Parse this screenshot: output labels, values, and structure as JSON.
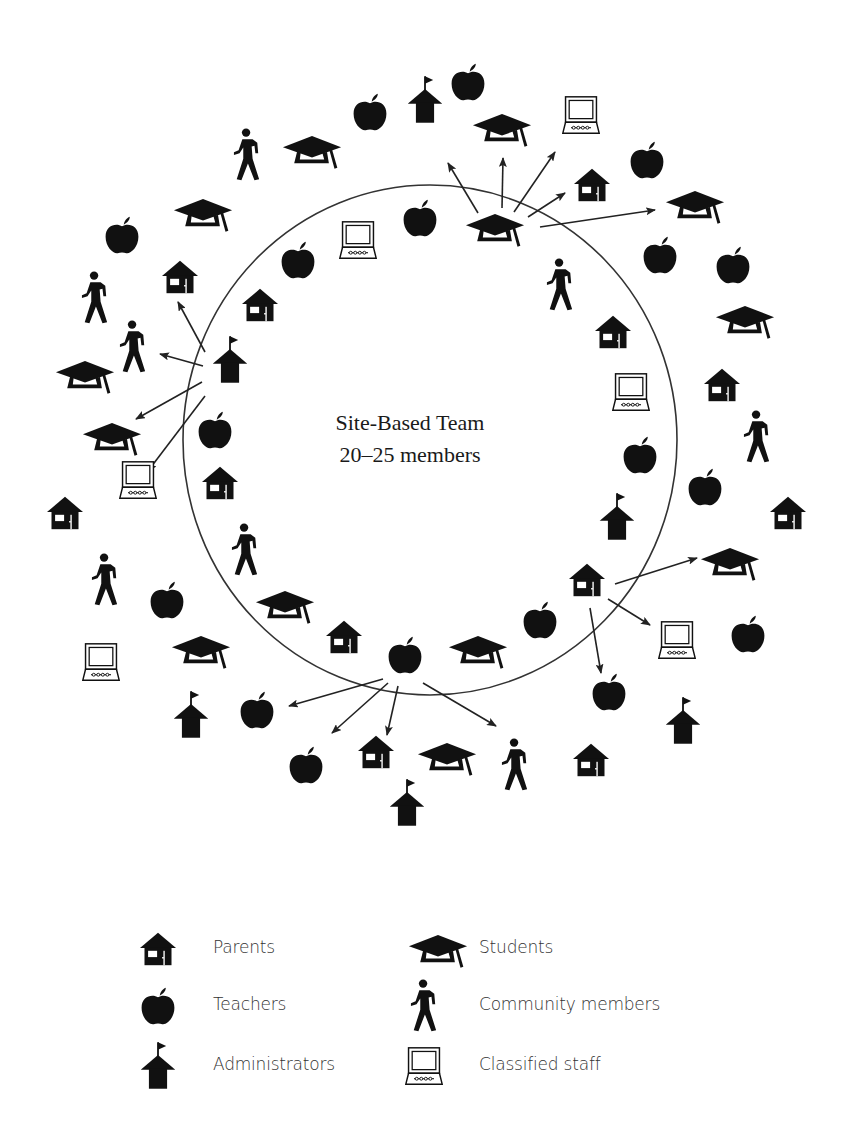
{
  "title": {
    "line1": "Site-Based Team",
    "line2": "20–25 members"
  },
  "circle": {
    "cx": 430,
    "cy": 440,
    "rx": 247,
    "ry": 255,
    "stroke": "#333333"
  },
  "colors": {
    "ink": "#111111",
    "line": "#333333",
    "background": "#ffffff"
  },
  "legend": {
    "items": [
      {
        "icon": "parent-house-icon",
        "symbol": "house",
        "label": "Parents",
        "x": 158,
        "y": 949
      },
      {
        "icon": "teacher-apple-icon",
        "symbol": "apple",
        "label": "Teachers",
        "x": 158,
        "y": 1006
      },
      {
        "icon": "administrator-school-icon",
        "symbol": "school",
        "label": "Administrators",
        "x": 158,
        "y": 1066
      },
      {
        "icon": "student-cap-icon",
        "symbol": "cap",
        "label": "Students",
        "x": 424,
        "y": 949
      },
      {
        "icon": "community-walker-icon",
        "symbol": "walker",
        "label": "Community members",
        "x": 424,
        "y": 1006
      },
      {
        "icon": "classified-computer-icon",
        "symbol": "computer",
        "label": "Classified staff",
        "x": 424,
        "y": 1066
      }
    ]
  },
  "icons": [
    {
      "type": "walker",
      "x": 247,
      "y": 155
    },
    {
      "type": "cap",
      "x": 312,
      "y": 150
    },
    {
      "type": "apple",
      "x": 370,
      "y": 112
    },
    {
      "type": "school",
      "x": 425,
      "y": 100
    },
    {
      "type": "apple",
      "x": 468,
      "y": 82
    },
    {
      "type": "cap",
      "x": 502,
      "y": 128
    },
    {
      "type": "computer",
      "x": 581,
      "y": 115
    },
    {
      "type": "apple",
      "x": 647,
      "y": 160
    },
    {
      "type": "cap",
      "x": 495,
      "y": 228
    },
    {
      "type": "apple",
      "x": 420,
      "y": 218
    },
    {
      "type": "computer",
      "x": 358,
      "y": 240
    },
    {
      "type": "apple",
      "x": 298,
      "y": 260
    },
    {
      "type": "house",
      "x": 592,
      "y": 185
    },
    {
      "type": "cap",
      "x": 695,
      "y": 205
    },
    {
      "type": "apple",
      "x": 660,
      "y": 255
    },
    {
      "type": "apple",
      "x": 733,
      "y": 265
    },
    {
      "type": "walker",
      "x": 560,
      "y": 285
    },
    {
      "type": "apple",
      "x": 122,
      "y": 235
    },
    {
      "type": "cap",
      "x": 203,
      "y": 213
    },
    {
      "type": "house",
      "x": 180,
      "y": 277
    },
    {
      "type": "walker",
      "x": 95,
      "y": 298
    },
    {
      "type": "walker",
      "x": 133,
      "y": 347
    },
    {
      "type": "house",
      "x": 260,
      "y": 305
    },
    {
      "type": "school",
      "x": 230,
      "y": 360
    },
    {
      "type": "cap",
      "x": 85,
      "y": 375
    },
    {
      "type": "cap",
      "x": 112,
      "y": 437
    },
    {
      "type": "apple",
      "x": 215,
      "y": 430
    },
    {
      "type": "computer",
      "x": 138,
      "y": 480
    },
    {
      "type": "house",
      "x": 65,
      "y": 513
    },
    {
      "type": "house",
      "x": 220,
      "y": 483
    },
    {
      "type": "walker",
      "x": 105,
      "y": 580
    },
    {
      "type": "walker",
      "x": 245,
      "y": 550
    },
    {
      "type": "apple",
      "x": 167,
      "y": 600
    },
    {
      "type": "cap",
      "x": 285,
      "y": 605
    },
    {
      "type": "computer",
      "x": 101,
      "y": 662
    },
    {
      "type": "cap",
      "x": 201,
      "y": 650
    },
    {
      "type": "house",
      "x": 344,
      "y": 637
    },
    {
      "type": "school",
      "x": 191,
      "y": 715
    },
    {
      "type": "apple",
      "x": 257,
      "y": 710
    },
    {
      "type": "apple",
      "x": 306,
      "y": 765
    },
    {
      "type": "apple",
      "x": 405,
      "y": 655
    },
    {
      "type": "cap",
      "x": 478,
      "y": 650
    },
    {
      "type": "apple",
      "x": 540,
      "y": 620
    },
    {
      "type": "house",
      "x": 376,
      "y": 752
    },
    {
      "type": "cap",
      "x": 447,
      "y": 757
    },
    {
      "type": "walker",
      "x": 515,
      "y": 765
    },
    {
      "type": "school",
      "x": 407,
      "y": 803
    },
    {
      "type": "house",
      "x": 587,
      "y": 580
    },
    {
      "type": "apple",
      "x": 609,
      "y": 692
    },
    {
      "type": "house",
      "x": 591,
      "y": 760
    },
    {
      "type": "school",
      "x": 683,
      "y": 721
    },
    {
      "type": "house",
      "x": 613,
      "y": 332
    },
    {
      "type": "computer",
      "x": 631,
      "y": 392
    },
    {
      "type": "cap",
      "x": 745,
      "y": 320
    },
    {
      "type": "house",
      "x": 722,
      "y": 385
    },
    {
      "type": "walker",
      "x": 757,
      "y": 437
    },
    {
      "type": "apple",
      "x": 640,
      "y": 455
    },
    {
      "type": "apple",
      "x": 705,
      "y": 487
    },
    {
      "type": "school",
      "x": 617,
      "y": 517
    },
    {
      "type": "house",
      "x": 788,
      "y": 513
    },
    {
      "type": "cap",
      "x": 730,
      "y": 562
    },
    {
      "type": "computer",
      "x": 677,
      "y": 640
    },
    {
      "type": "apple",
      "x": 748,
      "y": 634
    }
  ],
  "arrows": [
    {
      "from": "student-top",
      "x1": 478,
      "y1": 213,
      "x2": 448,
      "y2": 163
    },
    {
      "from": "student-top",
      "x1": 502,
      "y1": 208,
      "x2": 503,
      "y2": 158
    },
    {
      "from": "student-top",
      "x1": 514,
      "y1": 212,
      "x2": 555,
      "y2": 152
    },
    {
      "from": "student-top",
      "x1": 528,
      "y1": 217,
      "x2": 565,
      "y2": 193
    },
    {
      "from": "student-top",
      "x1": 540,
      "y1": 227,
      "x2": 655,
      "y2": 210
    },
    {
      "from": "admin-left",
      "x1": 205,
      "y1": 352,
      "x2": 178,
      "y2": 302
    },
    {
      "from": "admin-left",
      "x1": 203,
      "y1": 366,
      "x2": 160,
      "y2": 354
    },
    {
      "from": "admin-left",
      "x1": 202,
      "y1": 382,
      "x2": 136,
      "y2": 419
    },
    {
      "from": "admin-left",
      "x1": 205,
      "y1": 396,
      "x2": 148,
      "y2": 471
    },
    {
      "from": "teacher-bottom",
      "x1": 383,
      "y1": 679,
      "x2": 289,
      "y2": 706
    },
    {
      "from": "teacher-bottom",
      "x1": 388,
      "y1": 683,
      "x2": 332,
      "y2": 733
    },
    {
      "from": "teacher-bottom",
      "x1": 398,
      "y1": 686,
      "x2": 387,
      "y2": 735
    },
    {
      "from": "teacher-bottom",
      "x1": 423,
      "y1": 683,
      "x2": 496,
      "y2": 726
    },
    {
      "from": "parent-right",
      "x1": 615,
      "y1": 584,
      "x2": 697,
      "y2": 558
    },
    {
      "from": "parent-right",
      "x1": 608,
      "y1": 599,
      "x2": 650,
      "y2": 625
    },
    {
      "from": "parent-right",
      "x1": 590,
      "y1": 608,
      "x2": 601,
      "y2": 673
    }
  ]
}
